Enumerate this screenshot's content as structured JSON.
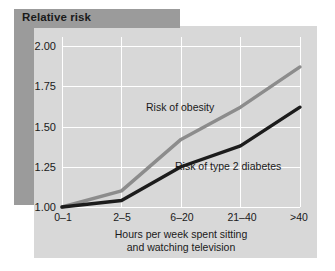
{
  "figure": {
    "title": "Relative risk",
    "colors": {
      "panel_bg": "#d8d8d8",
      "shadow_band": "#9b9b9b",
      "gridline": "#ffffff",
      "obesity_line": "#8c8c8c",
      "diabetes_line": "#1c1c1c",
      "text": "#1a1a1a"
    }
  },
  "chart_data": {
    "type": "line",
    "title": "Relative risk",
    "xlabel": "Hours per week spent sitting and watching television",
    "xlabel_line1": "Hours per week spent sitting",
    "xlabel_line2": "and watching television",
    "ylabel": "Relative risk",
    "categories": [
      "0–1",
      "2–5",
      "6–20",
      "21–40",
      ">40"
    ],
    "ylim": [
      1.0,
      2.0
    ],
    "yticks": [
      "1.00",
      "1.25",
      "1.50",
      "1.75",
      "2.00"
    ],
    "ytick_values": [
      1.0,
      1.25,
      1.5,
      1.75,
      2.0
    ],
    "grid": true,
    "legend_position": "inline-labels",
    "series": [
      {
        "name": "Risk of obesity",
        "color": "#8c8c8c",
        "values": [
          1.0,
          1.1,
          1.42,
          1.62,
          1.87
        ]
      },
      {
        "name": "Risk of type 2 diabetes",
        "color": "#1c1c1c",
        "values": [
          1.0,
          1.04,
          1.25,
          1.38,
          1.62
        ]
      }
    ]
  }
}
